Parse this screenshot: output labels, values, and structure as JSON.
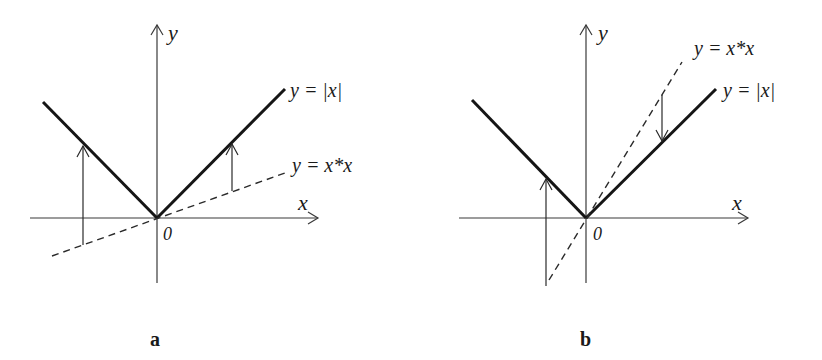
{
  "figure": {
    "panels": [
      {
        "id": "a",
        "caption": "a",
        "y_axis_label": "y",
        "x_axis_label": "x",
        "origin_label": "0",
        "curve_abs_label": "y = |x|",
        "curve_line_label": "y = x*x",
        "description": "Graph of y=|x| (solid) and a shallow line y=x*x (dashed, slope < 1); vertical arrows point up from the dashed line to |x|"
      },
      {
        "id": "b",
        "caption": "b",
        "y_axis_label": "y",
        "x_axis_label": "x",
        "origin_label": "0",
        "curve_abs_label": "y = |x|",
        "curve_line_label": "y = x*x",
        "description": "Graph of y=|x| (solid) and a steep line y=x*x (dashed, slope > 1); arrows point up (left side) and down (right side) from the dashed line to |x|"
      }
    ]
  }
}
